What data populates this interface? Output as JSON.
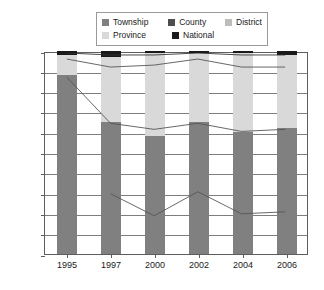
{
  "legend": {
    "rows": [
      [
        {
          "label": "Township",
          "color": "#808080"
        },
        {
          "label": "County",
          "color": "#4d4d4d"
        },
        {
          "label": "District",
          "color": "#bdbdbd"
        }
      ],
      [
        {
          "label": "Province",
          "color": "#d9d9d9"
        },
        {
          "label": "National",
          "color": "#1a1a1a"
        }
      ]
    ]
  },
  "axis": {
    "y_ticks": [
      "100%",
      "90%",
      "80%",
      "70%",
      "60%",
      "50%",
      "40%",
      "30%",
      "20%",
      "10%",
      "0%"
    ],
    "x_ticks": [
      "1995",
      "1997",
      "2000",
      "2002",
      "2004",
      "2006"
    ]
  },
  "chart_data": {
    "type": "bar",
    "title": "",
    "xlabel": "",
    "ylabel": "",
    "ylim": [
      0,
      100
    ],
    "grid": true,
    "legend_position": "top",
    "categories": [
      "1995",
      "1997",
      "2000",
      "2002",
      "2004",
      "2006"
    ],
    "stacked_series": [
      {
        "name": "Township",
        "color": "#808080",
        "values": [
          88,
          65,
          58,
          65,
          60,
          62
        ]
      },
      {
        "name": "Province",
        "color": "#d9d9d9",
        "values": [
          10,
          32,
          41,
          34,
          39,
          36
        ]
      },
      {
        "name": "National",
        "color": "#1a1a1a",
        "values": [
          2,
          3,
          1,
          1,
          1,
          2
        ]
      }
    ],
    "line_series": [
      {
        "name": "National-line",
        "color": "#333333",
        "values": [
          100,
          99,
          99,
          100,
          99,
          99
        ]
      },
      {
        "name": "District",
        "color": "#555555",
        "values": [
          97,
          93,
          94,
          97,
          93,
          93
        ]
      },
      {
        "name": "County",
        "color": "#555555",
        "values": [
          88,
          65,
          62,
          65,
          61,
          62
        ]
      },
      {
        "name": "County-lower",
        "color": "#555555",
        "values": [
          null,
          30,
          19,
          31,
          20,
          21
        ]
      }
    ]
  }
}
